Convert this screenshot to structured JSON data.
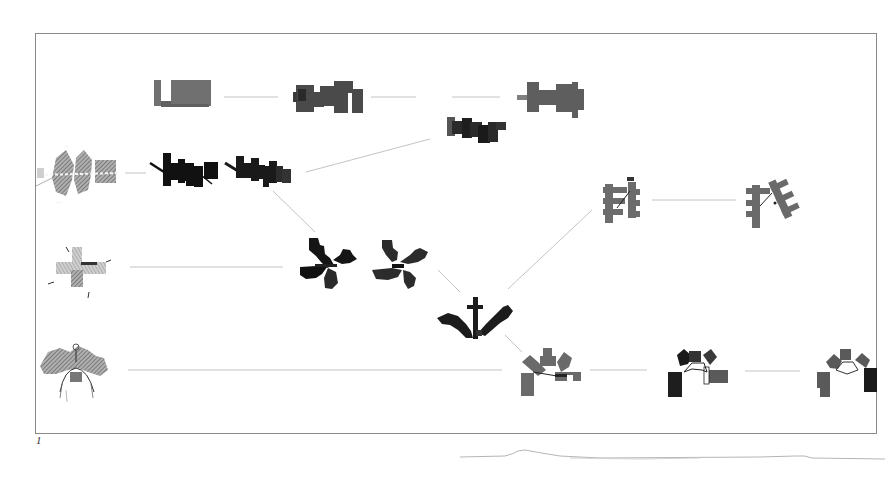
{
  "figure": {
    "label": "1",
    "type": "plan-evolution diagram",
    "frame": {
      "x": 35,
      "y": 33,
      "w": 842,
      "h": 401
    }
  },
  "colors": {
    "frame": "#8a8a8a",
    "edge": "#c4c4c4",
    "black_plan": "#141414",
    "dark_plan": "#2e2e2e",
    "mid_plan": "#5a5a5a",
    "grey_plan": "#6e6e6e",
    "sketch": "#8c8c8c"
  },
  "nodes": [
    {
      "id": "row1-a",
      "row": 1,
      "shape": "notched-rectangle",
      "tone": "grey",
      "cx": 183,
      "cy": 95
    },
    {
      "id": "row1-b",
      "row": 1,
      "shape": "stepped-block",
      "tone": "dark-grey",
      "cx": 327,
      "cy": 97
    },
    {
      "id": "row1-c",
      "row": 1,
      "shape": "stepped-block-tab",
      "tone": "grey",
      "cx": 550,
      "cy": 97
    },
    {
      "id": "row1-d",
      "row": 1,
      "shape": "jagged-strip",
      "tone": "dark",
      "cx": 476,
      "cy": 128
    },
    {
      "id": "row2-sketch",
      "row": 2,
      "shape": "hatched-sketch",
      "tone": "sketch",
      "cx": 75,
      "cy": 173
    },
    {
      "id": "row2-a",
      "row": 2,
      "shape": "sawtooth-strip",
      "tone": "black",
      "cx": 183,
      "cy": 172
    },
    {
      "id": "row2-b",
      "row": 2,
      "shape": "sawtooth-strip",
      "tone": "black",
      "cx": 257,
      "cy": 170
    },
    {
      "id": "row2-c",
      "row": 2,
      "shape": "branching-comb",
      "tone": "grey",
      "cx": 622,
      "cy": 200
    },
    {
      "id": "row2-d",
      "row": 2,
      "shape": "branching-comb-rotated",
      "tone": "grey",
      "cx": 773,
      "cy": 200
    },
    {
      "id": "row3-sketch",
      "row": 3,
      "shape": "cross-sketch",
      "tone": "sketch",
      "cx": 78,
      "cy": 267
    },
    {
      "id": "row3-a",
      "row": 3,
      "shape": "pinwheel",
      "tone": "black",
      "cx": 327,
      "cy": 263
    },
    {
      "id": "row3-b",
      "row": 3,
      "shape": "pinwheel",
      "tone": "dark",
      "cx": 402,
      "cy": 263
    },
    {
      "id": "row3-c",
      "row": 3,
      "shape": "v-wings-with-mast",
      "tone": "black",
      "cx": 476,
      "cy": 318
    },
    {
      "id": "row4-sketch",
      "row": 4,
      "shape": "fan-sketch",
      "tone": "sketch",
      "cx": 75,
      "cy": 372
    },
    {
      "id": "row4-a",
      "row": 4,
      "shape": "arch-cluster",
      "tone": "grey",
      "cx": 550,
      "cy": 372
    },
    {
      "id": "row4-b",
      "row": 4,
      "shape": "arch-cluster",
      "tone": "dark",
      "cx": 700,
      "cy": 372
    },
    {
      "id": "row4-c",
      "row": 4,
      "shape": "arch-cluster",
      "tone": "grey-dark",
      "cx": 850,
      "cy": 372
    }
  ],
  "edges": [
    {
      "from": "row1-a",
      "to": "row1-b",
      "x1": 224,
      "y1": 97,
      "x2": 278,
      "y2": 97
    },
    {
      "from": "row1-b",
      "to": "row1-c",
      "x1": 371,
      "y1": 97,
      "x2": 416,
      "y2": 97
    },
    {
      "from": "row1-c",
      "to": "row1-c",
      "x1": 452,
      "y1": 97,
      "x2": 500,
      "y2": 97
    },
    {
      "from": "row2-sketch",
      "to": "row2-a",
      "x1": 125,
      "y1": 173,
      "x2": 146,
      "y2": 173
    },
    {
      "from": "row2-b",
      "to": "row1-d",
      "x1": 306,
      "y1": 172,
      "x2": 430,
      "y2": 139
    },
    {
      "from": "row2-b",
      "to": "row3-a",
      "x1": 273,
      "y1": 191,
      "x2": 315,
      "y2": 232
    },
    {
      "from": "row3-sketch",
      "to": "row3-a",
      "x1": 130,
      "y1": 267,
      "x2": 283,
      "y2": 267
    },
    {
      "from": "row3-b",
      "to": "row3-c",
      "x1": 438,
      "y1": 270,
      "x2": 460,
      "y2": 292
    },
    {
      "from": "row3-c",
      "to": "row2-c",
      "x1": 508,
      "y1": 289,
      "x2": 592,
      "y2": 210
    },
    {
      "from": "row2-c",
      "to": "row2-d",
      "x1": 652,
      "y1": 200,
      "x2": 736,
      "y2": 200
    },
    {
      "from": "row3-c",
      "to": "row4-a",
      "x1": 505,
      "y1": 335,
      "x2": 522,
      "y2": 352
    },
    {
      "from": "row4-sketch",
      "to": "row4-a",
      "x1": 128,
      "y1": 370,
      "x2": 502,
      "y2": 370
    },
    {
      "from": "row4-a",
      "to": "row4-b",
      "x1": 590,
      "y1": 370,
      "x2": 647,
      "y2": 370
    },
    {
      "from": "row4-b",
      "to": "row4-c",
      "x1": 745,
      "y1": 371,
      "x2": 800,
      "y2": 371
    }
  ]
}
